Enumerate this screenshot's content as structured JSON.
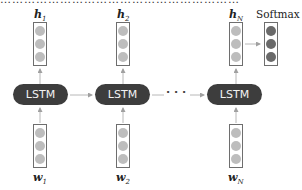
{
  "diagram": {
    "top_cut_text": "……………………………………………………",
    "outputs": [
      {
        "var": "h",
        "sub": "1"
      },
      {
        "var": "h",
        "sub": "2"
      },
      {
        "var": "h",
        "sub": "N"
      }
    ],
    "softmax_label": "Softmax",
    "cells": [
      {
        "label": "LSTM"
      },
      {
        "label": "LSTM"
      },
      {
        "label": "LSTM"
      }
    ],
    "ellipsis": "· · ·",
    "inputs": [
      {
        "var": "w",
        "sub": "1"
      },
      {
        "var": "w",
        "sub": "2"
      },
      {
        "var": "w",
        "sub": "N"
      }
    ],
    "colors": {
      "cell_fill": "#3d3d3d",
      "cell_text": "#f2f2f2",
      "vector_dot": "#bdbdbd",
      "softmax_dot": "#6a6a6a",
      "arrow": "#b0b0b0"
    }
  }
}
